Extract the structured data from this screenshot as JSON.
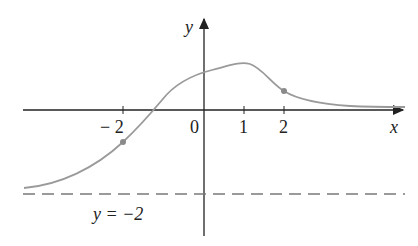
{
  "axes": {
    "x_label": "x",
    "y_label": "y",
    "origin_label": "0",
    "ticks": [
      {
        "value": -2,
        "label": "− 2"
      },
      {
        "value": 1,
        "label": "1"
      },
      {
        "value": 2,
        "label": "2"
      }
    ]
  },
  "asymptote": {
    "label": "y = −2",
    "y": -2
  },
  "colors": {
    "axis": "#222222",
    "curve": "#9a9a9a",
    "dash": "#7a7a7a",
    "point": "#8a8a8a"
  },
  "points": [
    {
      "x": -2,
      "y": -0.75
    },
    {
      "x": 2,
      "y": 0.45
    }
  ]
}
